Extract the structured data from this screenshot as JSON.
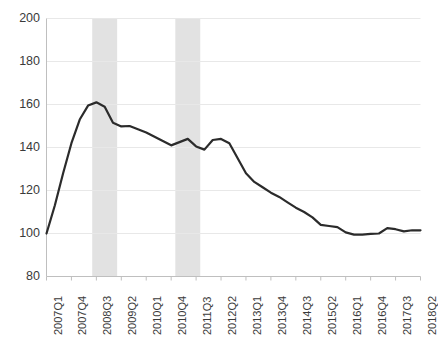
{
  "chart_data": {
    "type": "line",
    "title": "",
    "subtitle": "",
    "xlabel": "",
    "ylabel": "",
    "ylim": [
      80,
      200
    ],
    "yticks": [
      80,
      100,
      120,
      140,
      160,
      180,
      200
    ],
    "grid": true,
    "legend": null,
    "legend_position": "none",
    "line_color": "#2b2b2b",
    "shaded_band_color": "#e2e2e2",
    "gridline_color": "#e8e8e8",
    "axis_color": "#bfbfbf",
    "x": [
      "2007Q1",
      "2007Q2",
      "2007Q3",
      "2007Q4",
      "2008Q1",
      "2008Q2",
      "2008Q3",
      "2008Q4",
      "2009Q1",
      "2009Q2",
      "2009Q3",
      "2009Q4",
      "2010Q1",
      "2010Q2",
      "2010Q3",
      "2010Q4",
      "2011Q1",
      "2011Q2",
      "2011Q3",
      "2011Q4",
      "2012Q1",
      "2012Q2",
      "2012Q3",
      "2012Q4",
      "2013Q1",
      "2013Q2",
      "2013Q3",
      "2013Q4",
      "2014Q1",
      "2014Q2",
      "2014Q3",
      "2014Q4",
      "2015Q1",
      "2015Q2",
      "2015Q3",
      "2015Q4",
      "2016Q1",
      "2016Q2",
      "2016Q3",
      "2016Q4",
      "2017Q1",
      "2017Q2",
      "2017Q3",
      "2017Q4",
      "2018Q1",
      "2018Q2"
    ],
    "xtick_labels": [
      "2007Q1",
      "2007Q4",
      "2008Q3",
      "2009Q2",
      "2010Q1",
      "2010Q4",
      "2011Q3",
      "2012Q2",
      "2013Q1",
      "2013Q4",
      "2014Q3",
      "2015Q2",
      "2016Q1",
      "2016Q4",
      "2017Q3",
      "2018Q2"
    ],
    "xtick_every": 3,
    "values": [
      100.0,
      113.0,
      128.0,
      142.0,
      153.0,
      159.5,
      161.0,
      159.0,
      151.5,
      149.8,
      150.0,
      148.5,
      147.0,
      145.0,
      143.0,
      141.0,
      142.5,
      144.0,
      140.5,
      139.0,
      143.5,
      144.0,
      142.0,
      135.0,
      128.0,
      124.0,
      121.5,
      119.0,
      117.0,
      114.5,
      112.0,
      110.0,
      107.5,
      104.0,
      103.5,
      103.0,
      100.5,
      99.5,
      99.5,
      99.8,
      100.0,
      102.5,
      102.0,
      101.0,
      101.5,
      101.5
    ],
    "shaded_bands": [
      {
        "name": "recession-band-1",
        "start": "2008Q3",
        "end": "2009Q1"
      },
      {
        "name": "recession-band-2",
        "start": "2011Q1",
        "end": "2011Q3"
      }
    ]
  }
}
